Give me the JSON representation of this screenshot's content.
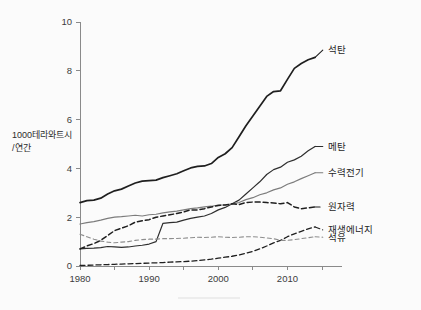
{
  "figure": {
    "background_color": "#fbfbfb",
    "axis_color": "#8a8a8a",
    "y_axis_title_line1": "1000테라와트시",
    "y_axis_title_line2": "/연간"
  },
  "axes": {
    "y_ticks": [
      "0",
      "2",
      "4",
      "6",
      "8",
      "10"
    ],
    "x_ticks": [
      "1980",
      "1990",
      "2000",
      "2010"
    ]
  },
  "labels": {
    "coal": "석탄",
    "methane": "메탄",
    "hydro": "수력전기",
    "nuclear": "원자력",
    "renewable": "재생에너지",
    "oil": "석유"
  },
  "chart_data": {
    "type": "line",
    "title": "",
    "xlabel": "",
    "ylabel": "1000테라와트시 /연간",
    "xlim": [
      1980,
      2015
    ],
    "ylim": [
      0,
      10
    ],
    "grid": false,
    "legend_position": "right-inline-labels",
    "x": [
      1980,
      1981,
      1982,
      1983,
      1984,
      1985,
      1986,
      1987,
      1988,
      1989,
      1990,
      1991,
      1992,
      1993,
      1994,
      1995,
      1996,
      1997,
      1998,
      1999,
      2000,
      2001,
      2002,
      2003,
      2004,
      2005,
      2006,
      2007,
      2008,
      2009,
      2010,
      2011,
      2012,
      2013,
      2014
    ],
    "series": [
      {
        "name": "석탄",
        "key": "coal",
        "color": "#1f1f1f",
        "style": "solid",
        "width": 1.7,
        "label_x": 2015.4,
        "label_y": 8.85,
        "values": [
          2.6,
          2.68,
          2.7,
          2.78,
          2.95,
          3.08,
          3.15,
          3.28,
          3.4,
          3.48,
          3.5,
          3.52,
          3.62,
          3.7,
          3.78,
          3.9,
          4.02,
          4.08,
          4.1,
          4.2,
          4.45,
          4.6,
          4.85,
          5.3,
          5.75,
          6.15,
          6.55,
          6.95,
          7.15,
          7.18,
          7.65,
          8.1,
          8.3,
          8.45,
          8.55
        ]
      },
      {
        "name": "메탄",
        "key": "methane",
        "color": "#2e2e2e",
        "style": "solid",
        "width": 1.2,
        "label_x": 2015.4,
        "label_y": 4.9,
        "values": [
          0.7,
          0.72,
          0.73,
          0.75,
          0.8,
          0.78,
          0.76,
          0.78,
          0.82,
          0.85,
          0.9,
          1.0,
          1.75,
          1.78,
          1.8,
          1.88,
          1.95,
          2.0,
          2.05,
          2.15,
          2.3,
          2.4,
          2.55,
          2.7,
          2.95,
          3.2,
          3.45,
          3.75,
          3.95,
          4.05,
          4.25,
          4.35,
          4.5,
          4.72,
          4.9
        ]
      },
      {
        "name": "수력전기",
        "key": "hydro",
        "color": "#7c7c7c",
        "style": "solid",
        "width": 1.2,
        "label_x": 2015.4,
        "label_y": 3.82,
        "values": [
          1.72,
          1.78,
          1.82,
          1.88,
          1.95,
          2.0,
          2.02,
          2.05,
          2.08,
          2.05,
          2.1,
          2.12,
          2.18,
          2.22,
          2.25,
          2.3,
          2.35,
          2.38,
          2.42,
          2.45,
          2.5,
          2.5,
          2.55,
          2.6,
          2.72,
          2.8,
          2.92,
          3.0,
          3.12,
          3.2,
          3.35,
          3.45,
          3.58,
          3.7,
          3.82
        ]
      },
      {
        "name": "원자력",
        "key": "nuclear",
        "color": "#1f1f1f",
        "style": "dashed",
        "width": 1.5,
        "dash": "5,3",
        "label_x": 2015.4,
        "label_y": 2.42,
        "values": [
          0.7,
          0.82,
          0.92,
          1.05,
          1.25,
          1.45,
          1.55,
          1.65,
          1.8,
          1.85,
          1.9,
          2.0,
          2.05,
          2.1,
          2.15,
          2.22,
          2.3,
          2.3,
          2.35,
          2.42,
          2.48,
          2.5,
          2.55,
          2.52,
          2.6,
          2.62,
          2.62,
          2.6,
          2.58,
          2.55,
          2.6,
          2.42,
          2.35,
          2.38,
          2.42
        ]
      },
      {
        "name": "재생에너지",
        "key": "renewable",
        "color": "#1f1f1f",
        "style": "dashed",
        "width": 1.3,
        "dash": "5,3",
        "label_x": 2015.4,
        "label_y": 1.48,
        "values": [
          0.02,
          0.03,
          0.04,
          0.05,
          0.06,
          0.07,
          0.08,
          0.09,
          0.1,
          0.11,
          0.12,
          0.13,
          0.14,
          0.16,
          0.17,
          0.18,
          0.2,
          0.22,
          0.25,
          0.28,
          0.32,
          0.36,
          0.4,
          0.45,
          0.52,
          0.6,
          0.7,
          0.82,
          0.95,
          1.05,
          1.2,
          1.32,
          1.42,
          1.52,
          1.6
        ]
      },
      {
        "name": "석유",
        "key": "oil",
        "color": "#8d8d8d",
        "style": "dashed",
        "width": 1.1,
        "dash": "4,3",
        "label_x": 2015.4,
        "label_y": 1.18,
        "values": [
          1.3,
          1.2,
          1.1,
          1.02,
          0.98,
          0.95,
          0.98,
          1.0,
          1.05,
          1.08,
          1.1,
          1.1,
          1.12,
          1.12,
          1.13,
          1.14,
          1.16,
          1.18,
          1.17,
          1.18,
          1.2,
          1.18,
          1.17,
          1.18,
          1.2,
          1.2,
          1.18,
          1.15,
          1.12,
          1.05,
          1.05,
          1.08,
          1.12,
          1.16,
          1.2
        ]
      }
    ]
  }
}
